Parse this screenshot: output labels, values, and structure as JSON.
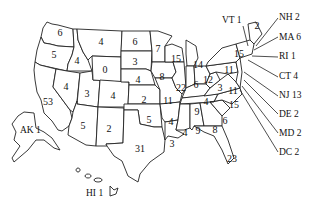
{
  "map_title": "",
  "states": {
    "WA": {
      "label": "6"
    },
    "OR": {
      "label": "5"
    },
    "CA": {
      "label": "53"
    },
    "ID": {
      "label": "4"
    },
    "NV": {
      "label": "4"
    },
    "UT": {
      "label": "3"
    },
    "AZ": {
      "label": "5"
    },
    "MT": {
      "label": "4"
    },
    "WY": {
      "label": "0"
    },
    "CO": {
      "label": "4"
    },
    "NM": {
      "label": "2"
    },
    "ND": {
      "label": "6"
    },
    "SD": {
      "label": "3"
    },
    "NE": {
      "label": "4"
    },
    "KS": {
      "label": "2"
    },
    "OK": {
      "label": "5"
    },
    "TX": {
      "label": "31"
    },
    "MN": {
      "label": "7"
    },
    "IA": {
      "label": "8"
    },
    "MO": {
      "label": "11"
    },
    "AR": {
      "label": "4"
    },
    "LA": {
      "label": "3"
    },
    "WI": {
      "label": "15"
    },
    "IL": {
      "label": "22"
    },
    "MI": {
      "label": "14"
    },
    "IN": {
      "label": "6"
    },
    "OH": {
      "label": "12"
    },
    "KY": {
      "label": "4"
    },
    "TN": {
      "label": "9"
    },
    "MS": {
      "label": "4"
    },
    "AL": {
      "label": "9"
    },
    "GA": {
      "label": "8"
    },
    "FL": {
      "label": "23"
    },
    "SC": {
      "label": "6"
    },
    "NC": {
      "label": "15"
    },
    "VA": {
      "label": "11"
    },
    "WV": {
      "label": "3"
    },
    "PA": {
      "label": "11"
    },
    "NY": {
      "label": "15"
    },
    "ME": {
      "label": "2"
    }
  },
  "callouts": {
    "VT": "VT 1",
    "NH": "NH 2",
    "MA": "MA 6",
    "RI": "RI 1",
    "CT": "CT 4",
    "NJ": "NJ 13",
    "DE": "DE 2",
    "MD": "MD 2",
    "DC": "DC 2",
    "AK": "AK 1",
    "HI": "HI 1"
  }
}
